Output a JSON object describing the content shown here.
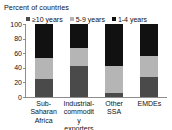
{
  "figure": {
    "clipped_top_text": "",
    "axis_caption": "Percent of countries"
  },
  "legend": {
    "items": [
      {
        "label": "≥10 years",
        "color": "#4a4a4a",
        "name": "legend-ge-10-years"
      },
      {
        "label": "5-9 years",
        "color": "#b5b5b5",
        "name": "legend-5-9-years"
      },
      {
        "label": "1-4 years",
        "color": "#111111",
        "name": "legend-1-4-years"
      }
    ]
  },
  "y_axis": {
    "ticks": [
      "100",
      "80",
      "60",
      "40",
      "20",
      "0"
    ]
  },
  "categories_display": [
    "Sub-\nSaharan\nAfrica",
    "Industrial-\ncommodity\nexporters",
    "Other\nSSA",
    "EMDEs"
  ],
  "chart_data": {
    "type": "bar",
    "subtype": "stacked-column-100percent",
    "title": "",
    "subtitle": "",
    "xlabel": "",
    "ylabel": "Percent of countries",
    "ylim": [
      0,
      100
    ],
    "yticks": [
      0,
      20,
      40,
      60,
      80,
      100
    ],
    "grid": false,
    "legend_position": "top",
    "categories": [
      "Sub-Saharan Africa",
      "Industrial-commodity exporters",
      "Other SSA",
      "EMDEs"
    ],
    "series": [
      {
        "name": "≥10 years",
        "color": "#4a4a4a",
        "values": [
          25,
          43,
          5,
          27
        ]
      },
      {
        "name": "5-9 years",
        "color": "#b5b5b5",
        "values": [
          28,
          24,
          38,
          29
        ]
      },
      {
        "name": "1-4 years",
        "color": "#111111",
        "values": [
          47,
          33,
          57,
          44
        ]
      }
    ]
  }
}
